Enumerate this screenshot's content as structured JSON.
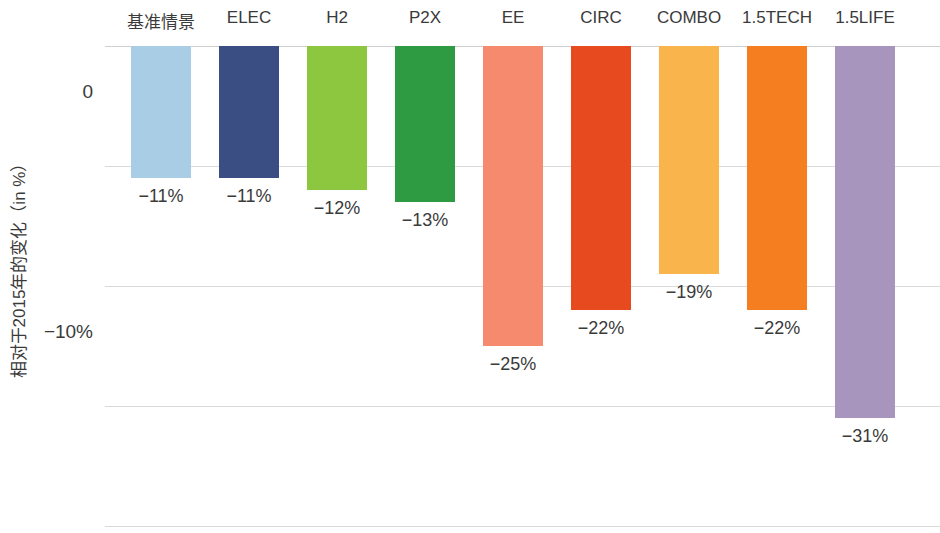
{
  "chart_data": {
    "type": "bar",
    "title": "",
    "subtitle": "",
    "xlabel": "",
    "ylabel": "相对于2015年的变化（in %）",
    "categories": [
      "基准情景",
      "ELEC",
      "H2",
      "P2X",
      "EE",
      "CIRC",
      "COMBO",
      "1.5TECH",
      "1.5LIFE"
    ],
    "values": [
      -11,
      -11,
      -12,
      -13,
      -25,
      -22,
      -19,
      -22,
      -31
    ],
    "value_labels": [
      "−11%",
      "−11%",
      "−12%",
      "−13%",
      "−25%",
      "−22%",
      "−19%",
      "−22%",
      "−31%"
    ],
    "colors": [
      "#a9cde5",
      "#3b4e84",
      "#8dc63f",
      "#2e9b43",
      "#f58a6e",
      "#e64a1e",
      "#f9b44c",
      "#f57f20",
      "#a895bd"
    ],
    "ylim": [
      -40,
      0
    ],
    "ytick_values": [
      0,
      -10,
      -20,
      -30,
      -40
    ],
    "ytick_labels": [
      "0",
      "−10%",
      "−20%",
      "−30%",
      "−40%"
    ],
    "grid": true,
    "legend": "none",
    "orientation": "vertical",
    "bar_width_px": 60,
    "bar_pitch_px": 88,
    "bar_first_center_px": 161,
    "zero_y_px": 46,
    "px_per_10pct": 120
  }
}
